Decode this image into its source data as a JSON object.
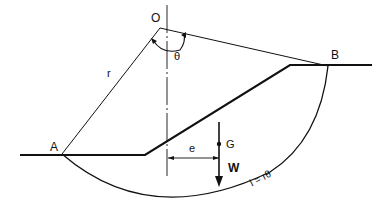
{
  "diagram": {
    "labels": {
      "center": "O",
      "angle": "θ",
      "radius": "r",
      "point_a": "A",
      "point_b": "B",
      "centroid": "G",
      "weight": "W",
      "eccentricity": "e",
      "arc_length": "l = rθ"
    },
    "colors": {
      "line": "#111111",
      "background": "#ffffff"
    }
  }
}
